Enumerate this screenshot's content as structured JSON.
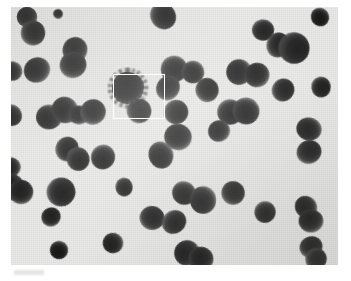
{
  "figure": {
    "caption": ""
  },
  "colors": {
    "background": "#ffffff",
    "plate_background": "#e9e9e7",
    "colony_dark": "#121212",
    "selection_stroke": "#ffffff"
  },
  "plate": {
    "x": 11,
    "y": 7,
    "width": 327,
    "height": 258
  },
  "selection_box": {
    "label": "selected-colony-roi",
    "x": 102,
    "y": 67,
    "width": 52,
    "height": 45,
    "stroke_width": 1.5
  },
  "chart_data": {
    "type": "scatter",
    "xlabel": "",
    "ylabel": "",
    "xlim": [
      0,
      327
    ],
    "ylim": [
      0,
      258
    ],
    "grid": false,
    "legend": "none",
    "annotations": [
      {
        "type": "rectangle",
        "name": "selection-box",
        "x": 102,
        "y": 67,
        "width": 52,
        "height": 45,
        "color": "#ffffff"
      }
    ],
    "series": [
      {
        "name": "smooth-colonies",
        "marker": "circle",
        "color": "#121212",
        "points": [
          {
            "x": 16,
            "y": 10,
            "r": 11
          },
          {
            "x": 47,
            "y": 7,
            "r": 5
          },
          {
            "x": 22,
            "y": 26,
            "r": 12
          },
          {
            "x": 152,
            "y": 9,
            "r": 13
          },
          {
            "x": 252,
            "y": 23,
            "r": 11
          },
          {
            "x": 309,
            "y": 10,
            "r": 9
          },
          {
            "x": 1,
            "y": 64,
            "r": 10
          },
          {
            "x": 26,
            "y": 63,
            "r": 13
          },
          {
            "x": 64,
            "y": 43,
            "r": 13
          },
          {
            "x": 62,
            "y": 58,
            "r": 13
          },
          {
            "x": 267,
            "y": 38,
            "r": 12
          },
          {
            "x": 283,
            "y": 41,
            "r": 16
          },
          {
            "x": 163,
            "y": 62,
            "r": 13
          },
          {
            "x": 182,
            "y": 65,
            "r": 12
          },
          {
            "x": 228,
            "y": 65,
            "r": 13
          },
          {
            "x": 246,
            "y": 68,
            "r": 12
          },
          {
            "x": 157,
            "y": 81,
            "r": 12
          },
          {
            "x": 196,
            "y": 83,
            "r": 12
          },
          {
            "x": 272,
            "y": 83,
            "r": 11
          },
          {
            "x": 310,
            "y": 80,
            "r": 10
          },
          {
            "x": 0,
            "y": 108,
            "r": 11
          },
          {
            "x": 38,
            "y": 110,
            "r": 13
          },
          {
            "x": 54,
            "y": 103,
            "r": 13
          },
          {
            "x": 68,
            "y": 108,
            "r": 10
          },
          {
            "x": 82,
            "y": 105,
            "r": 13
          },
          {
            "x": 128,
            "y": 104,
            "r": 12
          },
          {
            "x": 165,
            "y": 105,
            "r": 13
          },
          {
            "x": 219,
            "y": 105,
            "r": 13
          },
          {
            "x": 235,
            "y": 104,
            "r": 13
          },
          {
            "x": 298,
            "y": 122,
            "r": 12
          },
          {
            "x": 208,
            "y": 124,
            "r": 11
          },
          {
            "x": 167,
            "y": 130,
            "r": 13
          },
          {
            "x": 298,
            "y": 145,
            "r": 12
          },
          {
            "x": 56,
            "y": 142,
            "r": 12
          },
          {
            "x": 67,
            "y": 152,
            "r": 12
          },
          {
            "x": 92,
            "y": 150,
            "r": 12
          },
          {
            "x": 150,
            "y": 148,
            "r": 13
          },
          {
            "x": 0,
            "y": 160,
            "r": 10
          },
          {
            "x": 0,
            "y": 180,
            "r": 13
          },
          {
            "x": 10,
            "y": 185,
            "r": 13
          },
          {
            "x": 222,
            "y": 186,
            "r": 12
          },
          {
            "x": 50,
            "y": 185,
            "r": 14
          },
          {
            "x": 113,
            "y": 180,
            "r": 9
          },
          {
            "x": 173,
            "y": 186,
            "r": 12
          },
          {
            "x": 192,
            "y": 193,
            "r": 13
          },
          {
            "x": 295,
            "y": 200,
            "r": 11
          },
          {
            "x": 300,
            "y": 214,
            "r": 12
          },
          {
            "x": 40,
            "y": 210,
            "r": 10
          },
          {
            "x": 141,
            "y": 211,
            "r": 12
          },
          {
            "x": 163,
            "y": 215,
            "r": 12
          },
          {
            "x": 254,
            "y": 205,
            "r": 11
          },
          {
            "x": 48,
            "y": 243,
            "r": 9
          },
          {
            "x": 102,
            "y": 236,
            "r": 11
          },
          {
            "x": 176,
            "y": 246,
            "r": 13
          },
          {
            "x": 190,
            "y": 252,
            "r": 12
          },
          {
            "x": 300,
            "y": 240,
            "r": 11
          },
          {
            "x": 305,
            "y": 252,
            "r": 11
          }
        ]
      },
      {
        "name": "rough-colony-selected",
        "marker": "irregular",
        "color": "#0c0c0c",
        "points": [
          {
            "x": 117,
            "y": 81,
            "r": 17
          }
        ]
      }
    ]
  }
}
